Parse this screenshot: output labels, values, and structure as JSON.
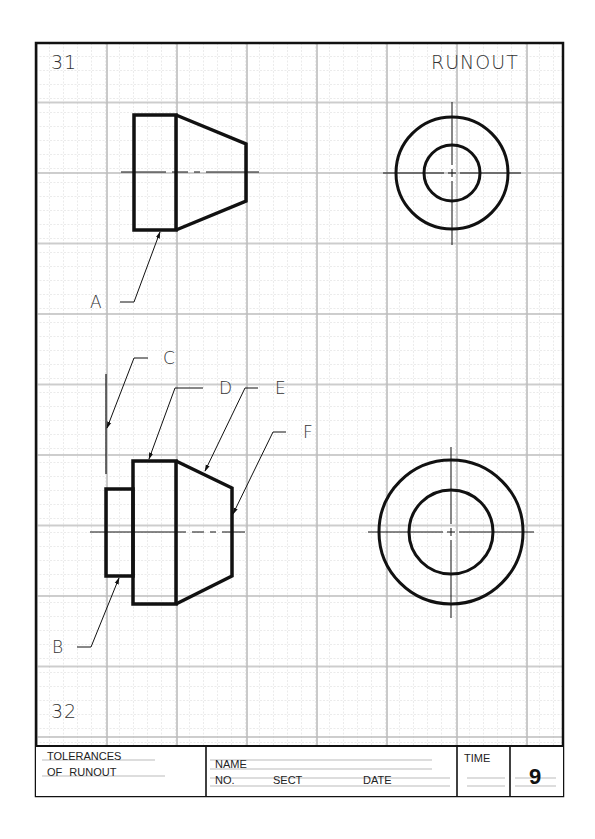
{
  "sheet": {
    "problem_top_number": "31",
    "problem_bottom_number": "32",
    "title": "RUNOUT"
  },
  "upper_drawing": {
    "callouts": [
      {
        "label": "A"
      }
    ]
  },
  "lower_drawing": {
    "callouts": [
      {
        "label": "B"
      },
      {
        "label": "C"
      },
      {
        "label": "D"
      },
      {
        "label": "E"
      },
      {
        "label": "F"
      }
    ]
  },
  "title_block": {
    "title_line1": "TOLERANCES",
    "title_line2": "OF RUNOUT",
    "name_label": "NAME",
    "no_label": "NO.",
    "sect_label": "SECT",
    "date_label": "DATE",
    "time_label": "TIME",
    "sheet_number": "9"
  },
  "colors": {
    "grid_minor": "#d4d4d4",
    "grid_major": "#b8b8b8",
    "ink": "#111111",
    "paper": "#ffffff"
  }
}
